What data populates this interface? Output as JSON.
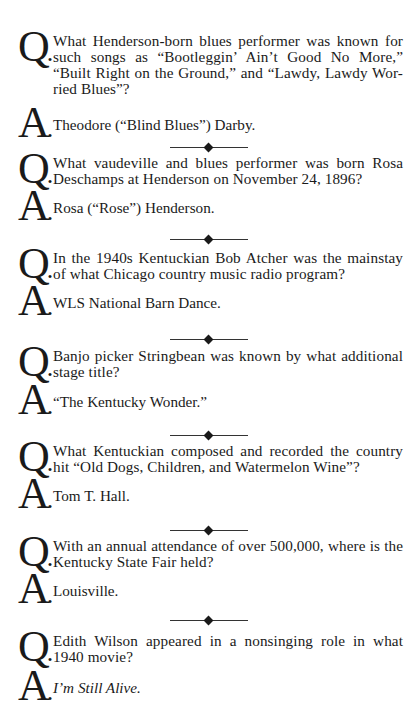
{
  "page": {
    "items": [
      {
        "q": "What Henderson-born blues performer was known for such songs as “Bootleggin’ Ain’t Good No More,” “Built Right on the Ground,” and “Lawdy, Lawdy Wor-ried Blues”?",
        "a": "Theodore (“Blind Blues”) Darby."
      },
      {
        "q": "What vaudeville and blues performer was born Rosa Deschamps at Henderson on November 24, 1896?",
        "a": "Rosa (“Rose”) Henderson."
      },
      {
        "q": "In the 1940s Kentuckian Bob Atcher was the mainstay of what Chicago country music radio program?",
        "a": "WLS National Barn Dance."
      },
      {
        "q": "Banjo picker Stringbean was known by what additional stage title?",
        "a": "“The Kentucky Wonder.”"
      },
      {
        "q": "What Kentuckian composed and recorded the country hit “Old Dogs, Children, and Watermelon Wine”?",
        "a": "Tom T. Hall."
      },
      {
        "q": "With an annual attendance of over 500,000, where is the Kentucky State Fair held?",
        "a": "Louisville."
      },
      {
        "q": "Edith Wilson appeared in a nonsinging role in what 1940 movie?",
        "a": "I’m Still Alive."
      }
    ],
    "q_letter": "Q",
    "a_letter": "A",
    "dot": "."
  }
}
